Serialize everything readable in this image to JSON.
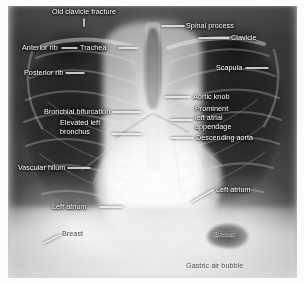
{
  "figure": {
    "kind": "annotated-chest-radiograph",
    "view": "frontal PA chest X-ray with labelled anatomy",
    "width": 304,
    "height": 284
  },
  "colors": {
    "label_text": "#ffffff",
    "label_text_on_bright": "#4a4a4a",
    "leader_line": "#ffffff",
    "film_dark": "#2b2b2b",
    "film_bright": "#fafafa",
    "page_background": "#ffffff"
  },
  "annotations": [
    {
      "id": "old-clavicle-fracture",
      "label": "Old clavicle fracture",
      "side": "center",
      "align": "center",
      "x": 78,
      "y": 8,
      "leader": {
        "type": "vertical-tick",
        "x1": 84,
        "y1": 19,
        "x2": 84,
        "y2": 25
      }
    },
    {
      "id": "spinal-process",
      "label": "Spinal process",
      "side": "right",
      "align": "left",
      "x": 186,
      "y": 22,
      "leader": {
        "type": "line",
        "x1": 162,
        "y1": 26,
        "x2": 184,
        "y2": 26
      }
    },
    {
      "id": "clavicle",
      "label": "Clavicle",
      "side": "right",
      "align": "left",
      "x": 231,
      "y": 34,
      "leader": {
        "type": "line",
        "x1": 199,
        "y1": 38,
        "x2": 229,
        "y2": 38
      }
    },
    {
      "id": "anterior-rib",
      "label": "Anterior rib",
      "side": "left",
      "align": "left",
      "x": 22,
      "y": 44,
      "leader": {
        "type": "line",
        "x1": 62,
        "y1": 48,
        "x2": 77,
        "y2": 48
      }
    },
    {
      "id": "trachea",
      "label": "Trachea",
      "side": "center",
      "align": "left",
      "x": 90,
      "y": 44,
      "leader": {
        "type": "line",
        "x1": 119,
        "y1": 48,
        "x2": 137,
        "y2": 48
      }
    },
    {
      "id": "posterior-rib",
      "label": "Posterior rib",
      "side": "left",
      "align": "left",
      "x": 24,
      "y": 69,
      "leader": {
        "type": "line",
        "x1": 66,
        "y1": 73,
        "x2": 84,
        "y2": 73
      }
    },
    {
      "id": "scapula",
      "label": "Scapula",
      "side": "right",
      "align": "left",
      "x": 216,
      "y": 64,
      "leader": {
        "type": "line",
        "x1": 246,
        "y1": 68,
        "x2": 268,
        "y2": 68
      }
    },
    {
      "id": "bronchial-bifurcation",
      "label": "Bronchial bifurcation",
      "side": "left",
      "align": "left",
      "x": 44,
      "y": 108,
      "leader": {
        "type": "line",
        "x1": 113,
        "y1": 112,
        "x2": 141,
        "y2": 112
      }
    },
    {
      "id": "aortic-knob",
      "label": "Aortic knob",
      "side": "right",
      "align": "left",
      "x": 193,
      "y": 93,
      "leader": {
        "type": "line",
        "x1": 165,
        "y1": 97,
        "x2": 190,
        "y2": 97
      }
    },
    {
      "id": "prominent-left-atrial-appendage",
      "label": "Prominent\nleft atrial\nappendage",
      "label_lines": [
        "Prominent",
        "left atrial",
        "appendage"
      ],
      "side": "right",
      "align": "left",
      "x": 195,
      "y": 108,
      "leader": {
        "type": "line",
        "x1": 171,
        "y1": 120,
        "x2": 192,
        "y2": 120
      }
    },
    {
      "id": "elevated-left-bronchus",
      "label": "Elevated left\nbronchus",
      "label_lines": [
        "Elevated left",
        "bronchus"
      ],
      "side": "left",
      "align": "left",
      "x": 60,
      "y": 121,
      "leader": {
        "type": "line",
        "x1": 112,
        "y1": 134,
        "x2": 141,
        "y2": 134
      }
    },
    {
      "id": "descending-aorta",
      "label": "Descending aorta",
      "side": "right",
      "align": "left",
      "x": 196,
      "y": 134,
      "leader": {
        "type": "line",
        "x1": 171,
        "y1": 138,
        "x2": 193,
        "y2": 138
      }
    },
    {
      "id": "vascular-hilum",
      "label": "Vascular hilum",
      "side": "left",
      "align": "left",
      "x": 18,
      "y": 164,
      "leader": {
        "type": "line",
        "x1": 68,
        "y1": 168,
        "x2": 90,
        "y2": 168
      }
    },
    {
      "id": "left-atrium-right-label",
      "label": "Left atrium",
      "side": "right",
      "align": "left",
      "x": 216,
      "y": 186,
      "leader": {
        "type": "diagonal",
        "x1": 192,
        "y1": 202,
        "x2": 213,
        "y2": 190
      }
    },
    {
      "id": "left-atrium-left-label",
      "label": "Left atrium",
      "side": "left",
      "align": "left",
      "x": 52,
      "y": 203,
      "leader": {
        "type": "line",
        "x1": 100,
        "y1": 207,
        "x2": 122,
        "y2": 207
      }
    },
    {
      "id": "breast-left",
      "label": "Breast",
      "side": "left",
      "align": "left",
      "x": 62,
      "y": 231,
      "leader": {
        "type": "diagonal",
        "x1": 44,
        "y1": 243,
        "x2": 60,
        "y2": 235
      }
    },
    {
      "id": "breast-right",
      "label": "Breast",
      "side": "right",
      "align": "left",
      "x": 214,
      "y": 231,
      "leader": {
        "type": "none"
      }
    },
    {
      "id": "gastric-air-bubble",
      "label": "Gastric air bubble",
      "side": "right",
      "align": "left",
      "x": 186,
      "y": 263,
      "leader": {
        "type": "none"
      }
    }
  ]
}
